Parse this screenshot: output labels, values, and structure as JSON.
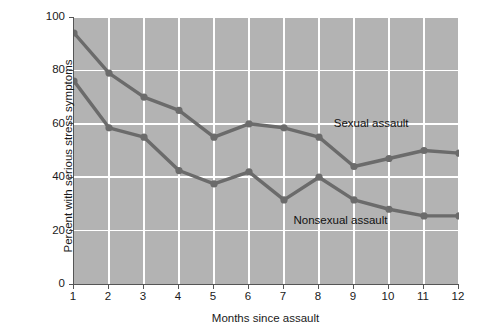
{
  "chart_data": {
    "type": "line",
    "title": "",
    "xlabel": "Months since assault",
    "ylabel": "Percent with serious stress symptoms",
    "x": [
      1,
      2,
      3,
      4,
      5,
      6,
      7,
      8,
      9,
      10,
      11,
      12
    ],
    "xticklabels": [
      "1",
      "2",
      "3",
      "4",
      "5",
      "6",
      "7",
      "8",
      "9",
      "10",
      "11",
      "12"
    ],
    "yticklabels": [
      "0",
      "20",
      "40",
      "60",
      "80",
      "100"
    ],
    "yticks": [
      0,
      20,
      40,
      60,
      80,
      100
    ],
    "xlim": [
      1,
      12
    ],
    "ylim": [
      0,
      100
    ],
    "grid": true,
    "legend_position": "inline-annotation",
    "series": [
      {
        "name": "Sexual assault",
        "values": [
          94,
          79,
          70,
          65,
          55,
          60,
          58.5,
          55,
          44,
          47,
          50,
          49
        ],
        "color": "#6b6b6b",
        "label_x": 8.45,
        "label_y": 60
      },
      {
        "name": "Nonsexual assault",
        "values": [
          76,
          58.5,
          55,
          42.5,
          37.5,
          42,
          31.5,
          40,
          31.5,
          28,
          25.5,
          25.5
        ],
        "color": "#6b6b6b",
        "label_x": 7.3,
        "label_y": 23.5
      }
    ],
    "colors": {
      "plot_background": "#b3b3b3",
      "gridline": "#ffffff",
      "line": "#6b6b6b",
      "marker": "#6b6b6b",
      "axis": "#555555",
      "text": "#1a1a1a",
      "page_background": "#ffffff"
    }
  }
}
